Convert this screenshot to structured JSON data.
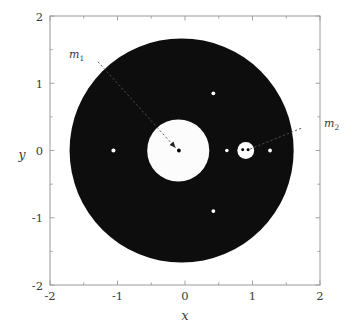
{
  "chart_data": {
    "type": "scatter",
    "title": "",
    "xlabel": "x",
    "ylabel": "y",
    "xlim": [
      -2,
      2
    ],
    "ylim": [
      -2,
      2
    ],
    "xticks": [
      -2,
      -1,
      0,
      1,
      2
    ],
    "yticks": [
      -2,
      -1,
      0,
      1,
      2
    ],
    "xticklabels": [
      "-2",
      "-1",
      "0",
      "1",
      "2"
    ],
    "yticklabels": [
      "-2",
      "-1",
      "0",
      "1",
      "2"
    ],
    "minor_ticks": [
      -1.5,
      -0.5,
      0.5,
      1.5
    ],
    "grid": false,
    "legend": null,
    "background_color": "#ffffff",
    "region_color": "#0d0d0d",
    "hole_color": "#fcfcfc",
    "marker_color": "#ffffff",
    "body_color": "#000000",
    "axis_color": "#9a9a9a",
    "regions": [
      {
        "name": "forbidden-region-disk",
        "shape": "circle",
        "cx": -0.05,
        "cy": 0.0,
        "r": 1.66,
        "fill": "region"
      },
      {
        "name": "primary-cavity",
        "shape": "circle",
        "cx": -0.1,
        "cy": 0.0,
        "r": 0.46,
        "fill": "hole"
      },
      {
        "name": "secondary-cavity",
        "shape": "circle",
        "cx": 0.9,
        "cy": 0.0,
        "r": 0.125,
        "fill": "hole"
      }
    ],
    "bodies": [
      {
        "name": "m1",
        "x": -0.09,
        "y": 0.0,
        "r": 0.028,
        "color": "body"
      },
      {
        "name": "m2-a",
        "x": 0.855,
        "y": 0.01,
        "r": 0.022,
        "color": "body"
      },
      {
        "name": "m2-b",
        "x": 0.935,
        "y": 0.01,
        "r": 0.022,
        "color": "body"
      }
    ],
    "points": [
      {
        "name": "point-left",
        "x": -1.06,
        "y": 0.0,
        "r": 0.03,
        "color": "marker"
      },
      {
        "name": "point-inner-right",
        "x": 0.62,
        "y": 0.0,
        "r": 0.026,
        "color": "marker"
      },
      {
        "name": "point-outer-right",
        "x": 1.26,
        "y": 0.0,
        "r": 0.028,
        "color": "marker"
      },
      {
        "name": "point-upper",
        "x": 0.42,
        "y": 0.85,
        "r": 0.028,
        "color": "marker"
      },
      {
        "name": "point-lower",
        "x": 0.42,
        "y": -0.9,
        "r": 0.028,
        "color": "marker"
      }
    ],
    "annotations": [
      {
        "name": "m1",
        "label": "m",
        "subscript": "1",
        "label_x": -1.42,
        "label_y": 1.46,
        "arrow_from_x": -1.29,
        "arrow_from_y": 1.32,
        "arrow_to_x": -0.14,
        "arrow_to_y": 0.04,
        "arrowhead": true
      },
      {
        "name": "m2",
        "label": "m",
        "subscript": "2",
        "label_x": 1.83,
        "label_y": 0.39,
        "arrow_from_x": 1.72,
        "arrow_from_y": 0.33,
        "arrow_to_x": 0.96,
        "arrow_to_y": 0.02,
        "arrowhead": false
      }
    ]
  },
  "labels": {
    "m1": "m",
    "m1_sub": "1",
    "m2": "m",
    "m2_sub": "2",
    "x_axis": "x",
    "y_axis": "y",
    "tick_neg2": "-2",
    "tick_neg1": "-1",
    "tick_0": "0",
    "tick_1": "1",
    "tick_2": "2"
  }
}
